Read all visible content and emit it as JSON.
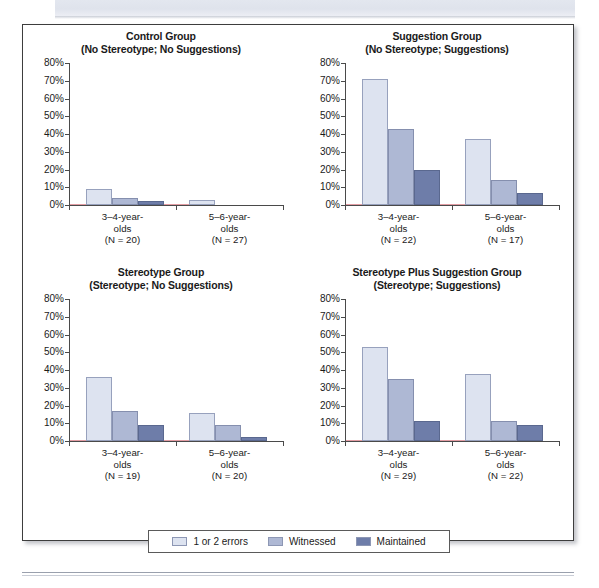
{
  "figure": {
    "series_names": [
      "1 or 2 errors",
      "Witnessed",
      "Maintained"
    ],
    "series_colors": [
      "#dde3f0",
      "#aeb8d4",
      "#6e7da9"
    ],
    "y_ticks": [
      "80%",
      "70%",
      "60%",
      "50%",
      "40%",
      "30%",
      "20%",
      "10%",
      "0%"
    ]
  },
  "legend": {
    "items": [
      {
        "label": "1 or 2 errors",
        "color": "#dde3f0"
      },
      {
        "label": "Witnessed",
        "color": "#aeb8d4"
      },
      {
        "label": "Maintained",
        "color": "#6e7da9"
      }
    ]
  },
  "panels": [
    {
      "title_line1": "Control Group",
      "title_line2": "(No Stereotype; No Suggestions)",
      "categories": [
        {
          "line1": "3–4-year-",
          "line2": "olds",
          "line3": "(N = 20)"
        },
        {
          "line1": "5–6-year-",
          "line2": "olds",
          "line3": "(N = 27)"
        }
      ]
    },
    {
      "title_line1": "Suggestion Group",
      "title_line2": "(No Stereotype; Suggestions)",
      "categories": [
        {
          "line1": "3–4-year-",
          "line2": "olds",
          "line3": "(N = 22)"
        },
        {
          "line1": "5–6-year-",
          "line2": "olds",
          "line3": "(N = 17)"
        }
      ]
    },
    {
      "title_line1": "Stereotype Group",
      "title_line2": "(Stereotype; No Suggestions)",
      "categories": [
        {
          "line1": "3–4-year-",
          "line2": "olds",
          "line3": "(N = 19)"
        },
        {
          "line1": "5–6-year-",
          "line2": "olds",
          "line3": "(N = 20)"
        }
      ]
    },
    {
      "title_line1": "Stereotype Plus Suggestion Group",
      "title_line2": "(Stereotype; Suggestions)",
      "categories": [
        {
          "line1": "3–4-year-",
          "line2": "olds",
          "line3": "(N = 29)"
        },
        {
          "line1": "5–6-year-",
          "line2": "olds",
          "line3": "(N = 22)"
        }
      ]
    }
  ],
  "chart_data": [
    {
      "type": "bar",
      "title": "Control Group (No Stereotype; No Suggestions)",
      "categories": [
        "3–4-year-olds (N = 20)",
        "5–6-year-olds (N = 27)"
      ],
      "series": [
        {
          "name": "1 or 2 errors",
          "values": [
            9,
            3
          ]
        },
        {
          "name": "Witnessed",
          "values": [
            4,
            0
          ]
        },
        {
          "name": "Maintained",
          "values": [
            2,
            0
          ]
        }
      ],
      "xlabel": "",
      "ylabel": "",
      "ylim": [
        0,
        80
      ],
      "ytick_step": 10,
      "grid": false,
      "legend_position": "bottom"
    },
    {
      "type": "bar",
      "title": "Suggestion Group (No Stereotype; Suggestions)",
      "categories": [
        "3–4-year-olds (N = 22)",
        "5–6-year-olds (N = 17)"
      ],
      "series": [
        {
          "name": "1 or 2 errors",
          "values": [
            71,
            37
          ]
        },
        {
          "name": "Witnessed",
          "values": [
            43,
            14
          ]
        },
        {
          "name": "Maintained",
          "values": [
            20,
            7
          ]
        }
      ],
      "xlabel": "",
      "ylabel": "",
      "ylim": [
        0,
        80
      ],
      "ytick_step": 10,
      "grid": false,
      "legend_position": "bottom"
    },
    {
      "type": "bar",
      "title": "Stereotype Group (Stereotype; No Suggestions)",
      "categories": [
        "3–4-year-olds (N = 19)",
        "5–6-year-olds (N = 20)"
      ],
      "series": [
        {
          "name": "1 or 2 errors",
          "values": [
            36,
            16
          ]
        },
        {
          "name": "Witnessed",
          "values": [
            17,
            9
          ]
        },
        {
          "name": "Maintained",
          "values": [
            9,
            2
          ]
        }
      ],
      "xlabel": "",
      "ylabel": "",
      "ylim": [
        0,
        80
      ],
      "ytick_step": 10,
      "grid": false,
      "legend_position": "bottom"
    },
    {
      "type": "bar",
      "title": "Stereotype Plus Suggestion Group (Stereotype; Suggestions)",
      "categories": [
        "3–4-year-olds (N = 29)",
        "5–6-year-olds (N = 22)"
      ],
      "series": [
        {
          "name": "1 or 2 errors",
          "values": [
            53,
            38
          ]
        },
        {
          "name": "Witnessed",
          "values": [
            35,
            11
          ]
        },
        {
          "name": "Maintained",
          "values": [
            11,
            9
          ]
        }
      ],
      "xlabel": "",
      "ylabel": "",
      "ylim": [
        0,
        80
      ],
      "ytick_step": 10,
      "grid": false,
      "legend_position": "bottom"
    }
  ]
}
